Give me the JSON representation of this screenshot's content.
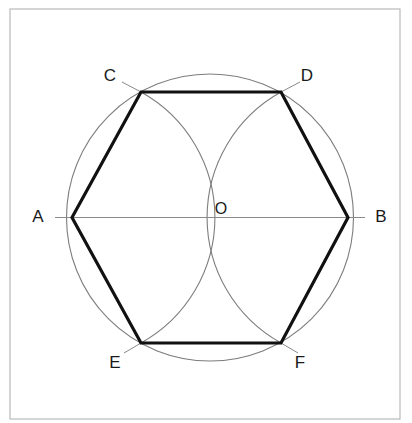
{
  "figure": {
    "type": "geometric-construction-diagram",
    "frame": {
      "x": 10,
      "y": 9,
      "width": 390,
      "height": 410,
      "stroke_color": "#b9b9b9",
      "stroke_width": 1.2,
      "fill_color": "#ffffff"
    },
    "circle": {
      "name": "circumscribed-circle",
      "center_x": 210,
      "center_y": 217.5,
      "radius": 143.5,
      "stroke_color": "#7d7d7d",
      "stroke_width": 1.1
    },
    "arcs": [
      {
        "name": "construction-arc-from-A",
        "center_x": 72,
        "center_y": 217.5,
        "radius": 143.5,
        "start_x": 141,
        "start_y": 92,
        "end_x": 141,
        "end_y": 343,
        "sweep": 1,
        "stroke_color": "#7d7d7d",
        "stroke_width": 1.1
      },
      {
        "name": "construction-arc-from-B",
        "center_x": 348,
        "center_y": 217.5,
        "radius": 143.5,
        "start_x": 281,
        "start_y": 92,
        "end_x": 281,
        "end_y": 343,
        "sweep": 0,
        "stroke_color": "#7d7d7d",
        "stroke_width": 1.1
      }
    ],
    "diameter_line": {
      "name": "diameter-AB",
      "x1": 55,
      "y1": 217.5,
      "x2": 365,
      "y2": 217.5,
      "stroke_color": "#8a8a8a",
      "stroke_width": 1.1
    },
    "hexagon": {
      "name": "inscribed-hexagon",
      "stroke_color": "#111111",
      "stroke_width": 3.2,
      "fill": "none",
      "vertex_order": [
        "A",
        "C",
        "D",
        "B",
        "F",
        "E"
      ],
      "points": "72,217.5 141,92 281,92 348,217.5 281,343 141,343"
    },
    "vertices": [
      {
        "id": "A",
        "label": "A",
        "x": 72,
        "y": 217.5,
        "label_x": 38,
        "label_y": 218
      },
      {
        "id": "B",
        "label": "B",
        "x": 348,
        "y": 217.5,
        "label_x": 381,
        "label_y": 218
      },
      {
        "id": "C",
        "label": "C",
        "x": 141,
        "y": 92,
        "label_x": 110,
        "label_y": 77
      },
      {
        "id": "D",
        "label": "D",
        "x": 281,
        "y": 92,
        "label_x": 307,
        "label_y": 77
      },
      {
        "id": "E",
        "label": "E",
        "x": 141,
        "y": 343,
        "label_x": 115,
        "label_y": 364
      },
      {
        "id": "F",
        "label": "F",
        "x": 281,
        "y": 343,
        "label_x": 300,
        "label_y": 364
      }
    ],
    "center_point": {
      "id": "O",
      "label": "O",
      "x": 210,
      "y": 217.5,
      "label_x": 221,
      "label_y": 210,
      "marker_radius": 6,
      "marker_stroke": "#1a1a1a"
    },
    "leader_ticks": [
      {
        "name": "leader-tick-C",
        "x1": 122,
        "y1": 82,
        "x2": 141,
        "y2": 92
      },
      {
        "name": "leader-tick-D",
        "x1": 300,
        "y1": 82,
        "x2": 281,
        "y2": 92
      },
      {
        "name": "leader-tick-E",
        "x1": 124,
        "y1": 353,
        "x2": 141,
        "y2": 343
      },
      {
        "name": "leader-tick-F",
        "x1": 298,
        "y1": 353,
        "x2": 281,
        "y2": 343
      }
    ],
    "leader_tick_style": {
      "stroke_color": "#8a8a8a",
      "stroke_width": 1.0
    }
  }
}
